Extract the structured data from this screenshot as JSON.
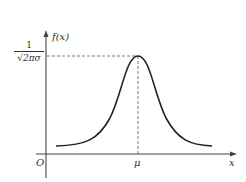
{
  "diagram": {
    "type": "normal-distribution-curve",
    "y_axis_label": "f(x)",
    "x_axis_label": "x",
    "origin_label": "O",
    "mean_label": "μ",
    "peak_value_label": {
      "numerator": "1",
      "denominator": "√2πσ"
    }
  }
}
